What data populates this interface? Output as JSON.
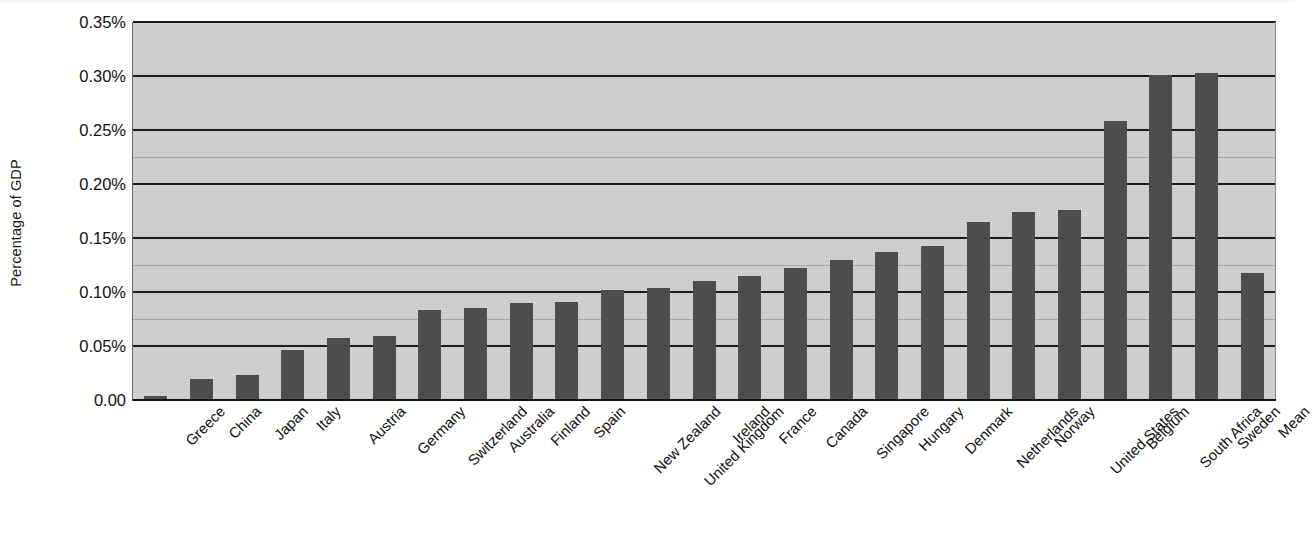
{
  "chart_data": {
    "type": "bar",
    "title": "",
    "subtitle": "",
    "xlabel": "",
    "ylabel": "Percentage of GDP",
    "ylim": [
      0,
      0.35
    ],
    "ytick_values": [
      0.35,
      0.3,
      0.25,
      0.2,
      0.15,
      0.1,
      0.05,
      0.0
    ],
    "ytick_labels": [
      "0.35%",
      "0.30%",
      "0.25%",
      "0.20%",
      "0.15%",
      "0.10%",
      "0.05%",
      "0.00"
    ],
    "grid": true,
    "grid_axis": "y",
    "legend": false,
    "legend_position": "none",
    "categories": [
      "Greece",
      "China",
      "Japan",
      "Italy",
      "Austria",
      "Germany",
      "Switzerland",
      "Australia",
      "Finland",
      "Spain",
      "New Zealand",
      "United Kingdom",
      "Ireland",
      "France",
      "Canada",
      "Singapore",
      "Hungary",
      "Denmark",
      "Netherlands",
      "Norway",
      "United States",
      "Belgium",
      "South Africa",
      "Sweden",
      "Mean"
    ],
    "values": [
      0.004,
      0.019,
      0.023,
      0.046,
      0.057,
      0.059,
      0.083,
      0.085,
      0.09,
      0.091,
      0.102,
      0.104,
      0.11,
      0.115,
      0.122,
      0.13,
      0.137,
      0.143,
      0.165,
      0.174,
      0.176,
      0.258,
      0.301,
      0.303,
      0.118
    ],
    "value_unit": "%",
    "bar_color": "#4d4d4d",
    "plot_background_color": "#c9c9c9",
    "axis_color": "#131313",
    "text_color": "#111111"
  }
}
